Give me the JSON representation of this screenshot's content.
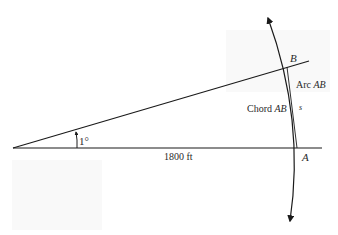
{
  "diagram": {
    "angle_label": "1°",
    "distance_label": "1800 ft",
    "point_a": "A",
    "point_b": "B",
    "arc_label_prefix": "Arc ",
    "arc_label_var": "AB",
    "chord_label_prefix": "Chord ",
    "chord_label_var": "AB",
    "arc_length_var": "s",
    "colors": {
      "line": "#1a1a1a",
      "text": "#2a2a2a",
      "background": "#ffffff"
    }
  }
}
